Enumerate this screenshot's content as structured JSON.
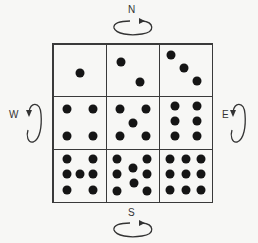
{
  "labels": {
    "north": "N",
    "south": "S",
    "west": "W",
    "east": "E"
  },
  "grid": {
    "rows": 3,
    "cols": 3,
    "cells": [
      {
        "count": 1,
        "dots": [
          [
            50,
            55
          ]
        ]
      },
      {
        "count": 2,
        "dots": [
          [
            28,
            33
          ],
          [
            65,
            72
          ]
        ]
      },
      {
        "count": 3,
        "dots": [
          [
            22,
            20
          ],
          [
            47,
            45
          ],
          [
            72,
            70
          ]
        ]
      },
      {
        "count": 4,
        "dots": [
          [
            25,
            22
          ],
          [
            75,
            22
          ],
          [
            25,
            75
          ],
          [
            75,
            75
          ]
        ]
      },
      {
        "count": 5,
        "dots": [
          [
            25,
            22
          ],
          [
            75,
            22
          ],
          [
            50,
            50
          ],
          [
            25,
            75
          ],
          [
            75,
            75
          ]
        ]
      },
      {
        "count": 6,
        "dots": [
          [
            30,
            18
          ],
          [
            72,
            18
          ],
          [
            30,
            47
          ],
          [
            72,
            47
          ],
          [
            30,
            76
          ],
          [
            72,
            76
          ]
        ]
      },
      {
        "count": 7,
        "dots": [
          [
            25,
            18
          ],
          [
            75,
            18
          ],
          [
            25,
            47
          ],
          [
            50,
            47
          ],
          [
            75,
            47
          ],
          [
            25,
            77
          ],
          [
            75,
            77
          ]
        ]
      },
      {
        "count": 8,
        "dots": [
          [
            20,
            18
          ],
          [
            78,
            18
          ],
          [
            50,
            35
          ],
          [
            20,
            47
          ],
          [
            78,
            47
          ],
          [
            52,
            65
          ],
          [
            20,
            80
          ],
          [
            78,
            80
          ]
        ]
      },
      {
        "count": 9,
        "dots": [
          [
            20,
            18
          ],
          [
            50,
            18
          ],
          [
            80,
            18
          ],
          [
            20,
            47
          ],
          [
            50,
            47
          ],
          [
            80,
            47
          ],
          [
            20,
            77
          ],
          [
            50,
            77
          ],
          [
            80,
            77
          ]
        ]
      }
    ]
  },
  "colors": {
    "line": "#3a3a3a",
    "dot": "#151515",
    "background": "#f7f7f5"
  }
}
